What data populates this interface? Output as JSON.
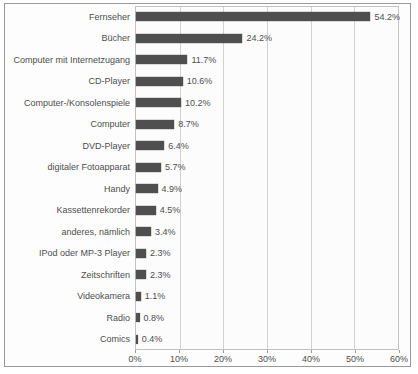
{
  "chart_data": {
    "type": "bar",
    "orientation": "horizontal",
    "title": "",
    "xlabel": "",
    "ylabel": "",
    "xlim": [
      0,
      60
    ],
    "grid": "vertical gridlines at 10% intervals",
    "legend": "none",
    "categories": [
      "Fernseher",
      "Bücher",
      "Computer mit Internetzugang",
      "CD-Player",
      "Computer-/Konsolenspiele",
      "Computer",
      "DVD-Player",
      "digitaler Fotoapparat",
      "Handy",
      "Kassettenrekorder",
      "anderes, nämlich",
      "IPod oder MP-3 Player",
      "Zeitschriften",
      "Videokamera",
      "Radio",
      "Comics"
    ],
    "values": [
      54.2,
      24.2,
      11.7,
      10.6,
      10.2,
      8.7,
      6.4,
      5.7,
      4.9,
      4.5,
      3.4,
      2.3,
      2.3,
      1.1,
      0.8,
      0.4
    ],
    "value_labels": [
      "54.2%",
      "24.2%",
      "11.7%",
      "10.6%",
      "10.2%",
      "8.7%",
      "6.4%",
      "5.7%",
      "4.9%",
      "4.5%",
      "3.4%",
      "2.3%",
      "2.3%",
      "1.1%",
      "0.8%",
      "0.4%"
    ],
    "x_ticks": [
      "0%",
      "10%",
      "20%",
      "30%",
      "40%",
      "50%",
      "60%"
    ],
    "x_tick_values": [
      0,
      10,
      20,
      30,
      40,
      50,
      60
    ]
  },
  "colors": {
    "bar": "#4f4f4f",
    "frame_border": "#9a9a9a",
    "plot_border": "#c2c2c2",
    "gridline": "#d2d2d2",
    "text": "#4e4e4e",
    "background": "#fdfdfd"
  }
}
